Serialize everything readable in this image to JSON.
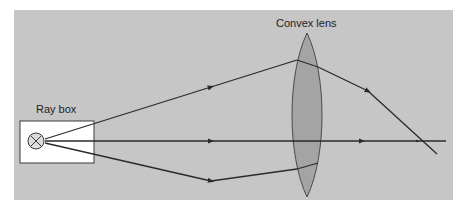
{
  "diagram": {
    "colors": {
      "background": "#ffffff",
      "panel": "#c6c6c6",
      "ray": "#2a2a2a",
      "lens_fill": "#a4a4a4",
      "lens_stroke": "#4a4a4a",
      "box_fill": "#ffffff",
      "bulb_fill": "#dcdcdc"
    },
    "labels": {
      "ray_box": "Ray box",
      "convex_lens": "Convex lens"
    },
    "components": [
      {
        "id": "ray-box",
        "label": "Ray box",
        "type": "light source with bulb"
      },
      {
        "id": "convex-lens",
        "label": "Convex lens",
        "type": "converging lens"
      },
      {
        "id": "focal-point",
        "label": "",
        "type": "point where rays converge"
      }
    ],
    "rays": [
      {
        "name": "upper ray",
        "direction": "diverges upward to lens, refracts downward to focal point"
      },
      {
        "name": "middle ray",
        "direction": "travels straight along principal axis"
      },
      {
        "name": "lower ray",
        "direction": "diverges downward to lens, refracts upward to focal point"
      }
    ]
  }
}
